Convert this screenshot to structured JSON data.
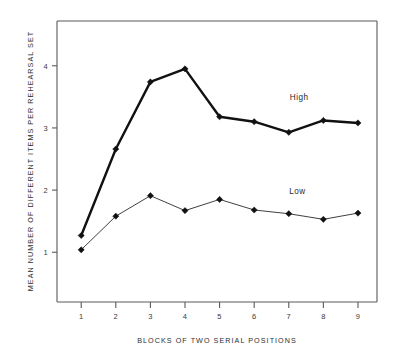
{
  "chart_data": {
    "type": "line",
    "title": "",
    "xlabel": "BLOCKS OF TWO SERIAL POSITIONS",
    "ylabel": "MEAN NUMBER OF DIFFERENT ITEMS PER REHEARSAL SET",
    "x": [
      1,
      2,
      3,
      4,
      5,
      6,
      7,
      8,
      9
    ],
    "xticklabels": [
      "1",
      "2",
      "3",
      "4",
      "5",
      "6",
      "7",
      "8",
      "9"
    ],
    "yticks": [
      1,
      2,
      3,
      4
    ],
    "yticklabels": [
      "1",
      "2",
      "3",
      "4"
    ],
    "xlim": [
      0.3,
      9.55
    ],
    "ylim": [
      0.2,
      4.72
    ],
    "grid": false,
    "legend_position": "inline-right",
    "series": [
      {
        "name": "High",
        "label": "High",
        "color": "#111111",
        "linewidth": 2.4,
        "marker": "diamond",
        "values": [
          1.27,
          2.66,
          3.74,
          3.95,
          3.18,
          3.1,
          2.93,
          3.12,
          3.08
        ],
        "label_x": 7.3,
        "label_y": 3.45
      },
      {
        "name": "Low",
        "label": "Low",
        "color": "#2a2a2a",
        "linewidth": 0.9,
        "marker": "diamond",
        "values": [
          1.04,
          1.58,
          1.91,
          1.67,
          1.85,
          1.68,
          1.62,
          1.53,
          1.63
        ],
        "label_x": 7.25,
        "label_y": 1.93
      }
    ],
    "annotations": [
      {
        "text": "High",
        "x": 7.3,
        "y": 3.45
      },
      {
        "text": "Low",
        "x": 7.25,
        "y": 1.93
      }
    ]
  },
  "colors": {
    "background": "#ffffff",
    "axis": "#5a5a5a",
    "text": "#2e2e2e",
    "series_high": "#111111",
    "series_low": "#2a2a2a"
  }
}
